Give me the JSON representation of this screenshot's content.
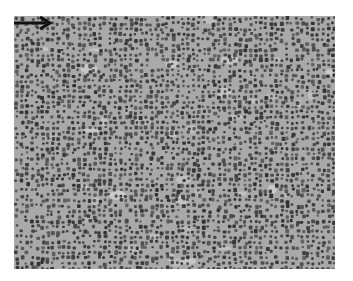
{
  "figure": {
    "type": "histology-micrograph",
    "stain": "grayscale",
    "colors": {
      "page_background": "#ffffff",
      "tissue_background": "#a9a9a9",
      "nucleus": "#4a4a4a",
      "light_patch": "#d8d8d8",
      "arrow": "#111111"
    },
    "annotations": [
      {
        "kind": "arrow",
        "direction": "right",
        "icon": "arrow-right-icon"
      }
    ]
  }
}
